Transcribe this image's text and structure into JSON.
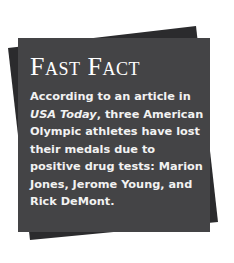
{
  "card": {
    "title": "Fast Fact",
    "body_pre": "According to an article in ",
    "body_em": "USA Today",
    "body_post": ", three American Olympic athletes have lost their medals due to positive drug tests: Marion Jones, Jerome Young, and Rick DeMont."
  },
  "colors": {
    "front_panel": "#444446",
    "back_panel": "#2b2b2d",
    "text": "#ffffff"
  }
}
